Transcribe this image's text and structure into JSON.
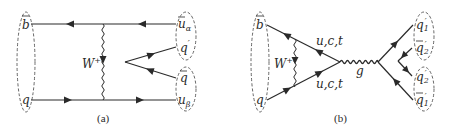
{
  "figure": {
    "panel_a": {
      "caption": "(a)",
      "boson_label": "W",
      "boson_sup": "+",
      "left_labels": {
        "top": "b",
        "bottom": "q"
      },
      "right_labels": {
        "top_main": "u",
        "top_sub": "α",
        "mid_top": "q",
        "mid_top_sup": "′",
        "mid_bottom": "q",
        "bottom_main": "u",
        "bottom_sub": "β"
      }
    },
    "panel_b": {
      "caption": "(b)",
      "boson_label": "W",
      "boson_sup": "+",
      "loop_label_top": "u,c,t",
      "loop_label_bottom": "u,c,t",
      "gluon_label": "g",
      "left_labels": {
        "top": "b",
        "bottom": "q"
      },
      "right_labels": {
        "q1p_main": "q",
        "q1p_sub": "1",
        "q1p_sup": "′",
        "q2bp_main": "q",
        "q2bp_sub": "2",
        "q2bp_sup": "′",
        "q2p_main": "q",
        "q2p_sub": "2",
        "q2p_sup": "′",
        "q1bp_main": "q",
        "q1bp_sub": "1",
        "q1bp_sup": "′"
      }
    },
    "colors": {
      "line": "#2a2a2a",
      "dashed": "#555555",
      "background": "#ffffff"
    }
  }
}
